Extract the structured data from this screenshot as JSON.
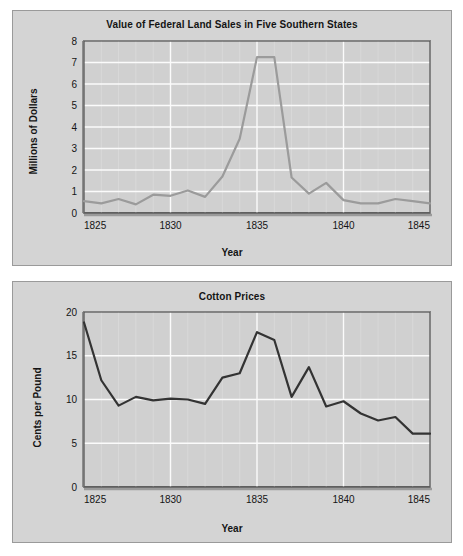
{
  "page": {
    "background": "#ffffff",
    "panel_background": "#d4d4d4"
  },
  "chart_data": [
    {
      "id": "land-sales",
      "type": "line",
      "title": "Value of Federal Land Sales in Five Southern States",
      "xlabel": "Year",
      "ylabel": "Millions of Dollars",
      "xlim": [
        1825,
        1845
      ],
      "ylim": [
        0,
        8
      ],
      "xticks": [
        1825,
        1830,
        1835,
        1840,
        1845
      ],
      "xtick_labels": [
        "1825",
        "1830",
        "1835",
        "1840",
        "1845"
      ],
      "yticks": [
        0,
        1,
        2,
        3,
        4,
        5,
        6,
        7,
        8
      ],
      "ytick_labels": [
        "0",
        "1",
        "2",
        "3",
        "4",
        "5",
        "6",
        "7",
        "8"
      ],
      "grid": true,
      "grid_color": "#f2f2f2",
      "line_color": "#9b9b9b",
      "legend": "none",
      "x": [
        1825,
        1826,
        1827,
        1828,
        1829,
        1830,
        1831,
        1832,
        1833,
        1834,
        1835,
        1836,
        1837,
        1838,
        1839,
        1840,
        1841,
        1842,
        1843,
        1844,
        1845
      ],
      "values": [
        0.55,
        0.45,
        0.65,
        0.4,
        0.85,
        0.8,
        1.05,
        0.75,
        1.7,
        3.45,
        7.25,
        7.25,
        1.65,
        0.9,
        1.4,
        0.6,
        0.45,
        0.45,
        0.65,
        0.55,
        0.45
      ]
    },
    {
      "id": "cotton-prices",
      "type": "line",
      "title": "Cotton Prices",
      "xlabel": "Year",
      "ylabel": "Cents per Pound",
      "xlim": [
        1825,
        1845
      ],
      "ylim": [
        0,
        20
      ],
      "xticks": [
        1825,
        1830,
        1835,
        1840,
        1845
      ],
      "xtick_labels": [
        "1825",
        "1830",
        "1835",
        "1840",
        "1845"
      ],
      "yticks": [
        0,
        5,
        10,
        15,
        20
      ],
      "ytick_labels": [
        "0",
        "5",
        "10",
        "15",
        "20"
      ],
      "grid": true,
      "grid_color": "#f2f2f2",
      "line_color": "#333333",
      "legend": "none",
      "x": [
        1825,
        1826,
        1827,
        1828,
        1829,
        1830,
        1831,
        1832,
        1833,
        1834,
        1835,
        1836,
        1837,
        1838,
        1839,
        1840,
        1841,
        1842,
        1843,
        1844,
        1845
      ],
      "values": [
        18.8,
        12.2,
        9.3,
        10.3,
        9.9,
        10.1,
        10.0,
        9.5,
        12.5,
        13.0,
        17.7,
        16.8,
        10.3,
        13.7,
        9.2,
        9.8,
        8.4,
        7.6,
        8.0,
        6.1,
        6.1
      ]
    }
  ]
}
